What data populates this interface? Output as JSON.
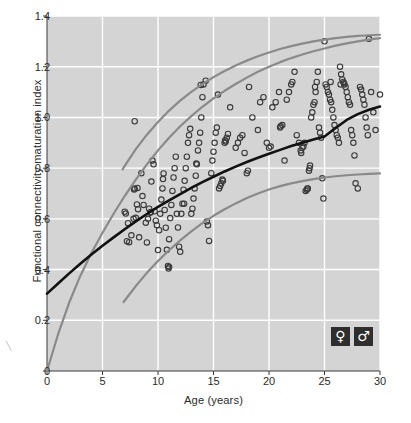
{
  "chart_data": {
    "type": "scatter",
    "title": "",
    "xlabel": "Age (years)",
    "ylabel": "Functional connectivity maturation index",
    "xlim": [
      0,
      30
    ],
    "ylim": [
      0,
      1.4
    ],
    "xticks": [
      "0",
      "5",
      "10",
      "15",
      "20",
      "25",
      "30"
    ],
    "yticks": [
      "0",
      "0.2",
      "0.4",
      "0.6",
      "0.8",
      "1.0",
      "1.2",
      "1.4"
    ],
    "xtick_values": [
      0,
      5,
      10,
      15,
      20,
      25,
      30
    ],
    "ytick_values": [
      0,
      0.2,
      0.4,
      0.6,
      0.8,
      1.0,
      1.2,
      1.4
    ],
    "grid": true,
    "grid_color": "#ffffff",
    "plot_background": "#d4d4d4",
    "marker": "open-circle",
    "marker_edge_color": "#3a3a3a",
    "marker_face_color": "none",
    "legend_position": "bottom-right",
    "legend": [
      {
        "symbol": "♀",
        "name": "female",
        "badge_color": "#2e2e2e"
      },
      {
        "symbol": "♂",
        "name": "male",
        "badge_color": "#2e2e2e"
      }
    ],
    "series": [
      {
        "name": "upper-percentile-curve",
        "type": "line",
        "color": "#8a8a8a",
        "width": 2.2,
        "points": [
          [
            0.0,
            0.0
          ],
          [
            1.0,
            0.145
          ],
          [
            2.0,
            0.27
          ],
          [
            3.0,
            0.375
          ],
          [
            4.0,
            0.465
          ],
          [
            5.0,
            0.545
          ],
          [
            6.0,
            0.62
          ],
          [
            7.0,
            0.69
          ],
          [
            8.0,
            0.755
          ],
          [
            9.0,
            0.815
          ],
          [
            10.0,
            0.87
          ],
          [
            11.0,
            0.92
          ],
          [
            12.0,
            0.965
          ],
          [
            13.0,
            1.005
          ],
          [
            14.0,
            1.042
          ],
          [
            15.0,
            1.075
          ],
          [
            16.0,
            1.105
          ],
          [
            17.0,
            1.132
          ],
          [
            18.0,
            1.157
          ],
          [
            19.0,
            1.18
          ],
          [
            20.0,
            1.2
          ],
          [
            21.0,
            1.218
          ],
          [
            22.0,
            1.234
          ],
          [
            23.0,
            1.248
          ],
          [
            24.0,
            1.261
          ],
          [
            25.0,
            1.272
          ],
          [
            26.0,
            1.283
          ],
          [
            27.0,
            1.292
          ],
          [
            28.0,
            1.3
          ],
          [
            29.0,
            1.307
          ],
          [
            30.0,
            1.313
          ]
        ]
      },
      {
        "name": "upper-sex-curve",
        "type": "line",
        "color": "#8a8a8a",
        "width": 2.2,
        "points": [
          [
            6.8,
            0.795
          ],
          [
            8.0,
            0.875
          ],
          [
            9.0,
            0.932
          ],
          [
            10.0,
            0.982
          ],
          [
            11.0,
            1.027
          ],
          [
            12.0,
            1.066
          ],
          [
            13.0,
            1.101
          ],
          [
            14.0,
            1.131
          ],
          [
            15.0,
            1.159
          ],
          [
            16.0,
            1.183
          ],
          [
            17.0,
            1.205
          ],
          [
            18.0,
            1.224
          ],
          [
            19.0,
            1.241
          ],
          [
            20.0,
            1.256
          ],
          [
            21.0,
            1.27
          ],
          [
            22.0,
            1.281
          ],
          [
            23.0,
            1.291
          ],
          [
            24.0,
            1.3
          ],
          [
            25.0,
            1.307
          ],
          [
            26.0,
            1.313
          ],
          [
            27.0,
            1.318
          ],
          [
            28.0,
            1.322
          ],
          [
            29.0,
            1.324
          ],
          [
            30.0,
            1.326
          ]
        ]
      },
      {
        "name": "mean-fit-curve",
        "type": "line",
        "color": "#111111",
        "width": 2.6,
        "points": [
          [
            0.0,
            0.305
          ],
          [
            1.0,
            0.345
          ],
          [
            2.0,
            0.385
          ],
          [
            3.0,
            0.423
          ],
          [
            4.0,
            0.459
          ],
          [
            5.0,
            0.494
          ],
          [
            6.0,
            0.527
          ],
          [
            7.0,
            0.559
          ],
          [
            8.0,
            0.59
          ],
          [
            9.0,
            0.619
          ],
          [
            10.0,
            0.647
          ],
          [
            11.0,
            0.673
          ],
          [
            12.0,
            0.698
          ],
          [
            13.0,
            0.722
          ],
          [
            14.0,
            0.745
          ],
          [
            15.0,
            0.766
          ],
          [
            16.0,
            0.787
          ],
          [
            17.0,
            0.806
          ],
          [
            18.0,
            0.824
          ],
          [
            19.0,
            0.841
          ],
          [
            20.0,
            0.857
          ],
          [
            21.0,
            0.872
          ],
          [
            22.0,
            0.887
          ],
          [
            23.0,
            0.9
          ],
          [
            24.0,
            0.913
          ],
          [
            25.0,
            0.925
          ],
          [
            26.0,
            0.958
          ],
          [
            27.0,
            0.99
          ],
          [
            28.0,
            1.013
          ],
          [
            29.0,
            1.03
          ],
          [
            30.0,
            1.043
          ]
        ]
      },
      {
        "name": "lower-sex-curve",
        "type": "line",
        "color": "#8a8a8a",
        "width": 2.2,
        "points": [
          [
            6.9,
            0.272
          ],
          [
            8.0,
            0.335
          ],
          [
            9.0,
            0.387
          ],
          [
            10.0,
            0.434
          ],
          [
            11.0,
            0.476
          ],
          [
            12.0,
            0.515
          ],
          [
            13.0,
            0.551
          ],
          [
            14.0,
            0.583
          ],
          [
            15.0,
            0.612
          ],
          [
            16.0,
            0.638
          ],
          [
            17.0,
            0.661
          ],
          [
            18.0,
            0.682
          ],
          [
            19.0,
            0.7
          ],
          [
            20.0,
            0.716
          ],
          [
            21.0,
            0.729
          ],
          [
            22.0,
            0.74
          ],
          [
            23.0,
            0.749
          ],
          [
            24.0,
            0.757
          ],
          [
            25.0,
            0.763
          ],
          [
            26.0,
            0.768
          ],
          [
            27.0,
            0.772
          ],
          [
            28.0,
            0.775
          ],
          [
            29.0,
            0.777
          ],
          [
            30.0,
            0.779
          ]
        ]
      }
    ],
    "points": [
      [
        7.9,
        0.985
      ],
      [
        7.0,
        0.628
      ],
      [
        7.1,
        0.621
      ],
      [
        7.3,
        0.583
      ],
      [
        7.2,
        0.512
      ],
      [
        7.4,
        0.508
      ],
      [
        7.6,
        0.535
      ],
      [
        7.8,
        0.6
      ],
      [
        7.9,
        0.72
      ],
      [
        7.85,
        0.716
      ],
      [
        8.0,
        0.604
      ],
      [
        8.1,
        0.657
      ],
      [
        8.2,
        0.638
      ],
      [
        8.3,
        0.527
      ],
      [
        8.5,
        0.78
      ],
      [
        8.6,
        0.69
      ],
      [
        8.7,
        0.655
      ],
      [
        8.9,
        0.585
      ],
      [
        9.0,
        0.507
      ],
      [
        9.1,
        0.6
      ],
      [
        9.2,
        0.64
      ],
      [
        9.3,
        0.624
      ],
      [
        9.4,
        0.747
      ],
      [
        9.5,
        0.83
      ],
      [
        9.6,
        0.815
      ],
      [
        9.7,
        0.63
      ],
      [
        9.8,
        0.593
      ],
      [
        9.9,
        0.575
      ],
      [
        10.0,
        0.477
      ],
      [
        10.1,
        0.555
      ],
      [
        10.2,
        0.62
      ],
      [
        10.3,
        0.676
      ],
      [
        10.4,
        0.72
      ],
      [
        10.45,
        0.757
      ],
      [
        10.5,
        0.779
      ],
      [
        10.6,
        0.635
      ],
      [
        10.7,
        0.565
      ],
      [
        10.8,
        0.478
      ],
      [
        10.9,
        0.414
      ],
      [
        10.95,
        0.404
      ],
      [
        11.0,
        0.52
      ],
      [
        11.1,
        0.603
      ],
      [
        11.2,
        0.655
      ],
      [
        11.3,
        0.71
      ],
      [
        11.4,
        0.763
      ],
      [
        11.5,
        0.8
      ],
      [
        11.6,
        0.845
      ],
      [
        11.7,
        0.62
      ],
      [
        11.8,
        0.566
      ],
      [
        11.9,
        0.49
      ],
      [
        12.0,
        0.47
      ],
      [
        12.1,
        0.62
      ],
      [
        12.2,
        0.66
      ],
      [
        12.3,
        0.715
      ],
      [
        12.4,
        0.75
      ],
      [
        12.5,
        0.8
      ],
      [
        12.6,
        0.845
      ],
      [
        12.7,
        0.9
      ],
      [
        12.8,
        0.93
      ],
      [
        12.9,
        0.955
      ],
      [
        13.0,
        0.62
      ],
      [
        13.1,
        0.64
      ],
      [
        13.2,
        0.68
      ],
      [
        13.3,
        0.72
      ],
      [
        13.4,
        0.77
      ],
      [
        13.5,
        0.815
      ],
      [
        13.6,
        0.87
      ],
      [
        13.7,
        0.9
      ],
      [
        13.8,
        0.94
      ],
      [
        13.9,
        1.0
      ],
      [
        14.0,
        1.08
      ],
      [
        13.85,
        1.128
      ],
      [
        14.1,
        1.13
      ],
      [
        14.3,
        1.145
      ],
      [
        14.4,
        0.59
      ],
      [
        14.5,
        0.575
      ],
      [
        14.6,
        0.513
      ],
      [
        14.8,
        0.78
      ],
      [
        14.9,
        0.83
      ],
      [
        15.0,
        0.865
      ],
      [
        15.1,
        0.9
      ],
      [
        15.2,
        0.94
      ],
      [
        15.3,
        0.96
      ],
      [
        15.4,
        1.09
      ],
      [
        15.5,
        0.72
      ],
      [
        15.6,
        0.73
      ],
      [
        15.7,
        0.74
      ],
      [
        15.8,
        0.755
      ],
      [
        16.0,
        0.9
      ],
      [
        16.1,
        0.905
      ],
      [
        16.2,
        0.92
      ],
      [
        16.3,
        0.935
      ],
      [
        16.5,
        1.04
      ],
      [
        17.0,
        0.88
      ],
      [
        17.2,
        0.9
      ],
      [
        17.4,
        0.92
      ],
      [
        17.6,
        0.93
      ],
      [
        17.8,
        0.86
      ],
      [
        18.0,
        0.78
      ],
      [
        18.2,
        1.12
      ],
      [
        18.5,
        1.0
      ],
      [
        19.0,
        0.95
      ],
      [
        19.2,
        1.06
      ],
      [
        19.5,
        1.08
      ],
      [
        19.8,
        0.9
      ],
      [
        20.0,
        0.88
      ],
      [
        20.3,
        1.04
      ],
      [
        20.6,
        1.06
      ],
      [
        20.9,
        1.1
      ],
      [
        21.0,
        0.96
      ],
      [
        21.2,
        0.97
      ],
      [
        21.4,
        0.83
      ],
      [
        21.6,
        1.07
      ],
      [
        21.8,
        1.1
      ],
      [
        22.0,
        1.13
      ],
      [
        22.1,
        1.14
      ],
      [
        22.3,
        1.18
      ],
      [
        22.5,
        0.93
      ],
      [
        22.7,
        0.9
      ],
      [
        22.9,
        0.86
      ],
      [
        23.0,
        0.88
      ],
      [
        23.1,
        0.885
      ],
      [
        23.2,
        0.9
      ],
      [
        23.3,
        0.71
      ],
      [
        23.4,
        0.715
      ],
      [
        23.5,
        0.72
      ],
      [
        23.6,
        0.79
      ],
      [
        23.65,
        0.8
      ],
      [
        23.7,
        0.81
      ],
      [
        23.8,
        1.0
      ],
      [
        23.9,
        1.02
      ],
      [
        24.0,
        1.05
      ],
      [
        24.1,
        1.06
      ],
      [
        24.2,
        1.1
      ],
      [
        24.3,
        1.14
      ],
      [
        24.4,
        1.18
      ],
      [
        24.5,
        0.96
      ],
      [
        24.6,
        0.94
      ],
      [
        24.7,
        0.92
      ],
      [
        24.8,
        0.76
      ],
      [
        24.9,
        0.68
      ],
      [
        25.0,
        1.3
      ],
      [
        25.1,
        1.13
      ],
      [
        25.2,
        1.12
      ],
      [
        25.3,
        1.1
      ],
      [
        25.4,
        1.09
      ],
      [
        25.5,
        1.07
      ],
      [
        25.6,
        1.06
      ],
      [
        25.7,
        1.03
      ],
      [
        25.8,
        1.0
      ],
      [
        25.9,
        0.97
      ],
      [
        26.0,
        0.95
      ],
      [
        26.1,
        0.93
      ],
      [
        26.2,
        0.92
      ],
      [
        26.3,
        0.9
      ],
      [
        26.4,
        1.2
      ],
      [
        26.5,
        1.17
      ],
      [
        26.6,
        1.15
      ],
      [
        26.7,
        1.14
      ],
      [
        26.75,
        1.135
      ],
      [
        26.8,
        1.13
      ],
      [
        26.9,
        1.12
      ],
      [
        27.0,
        1.1
      ],
      [
        27.1,
        1.08
      ],
      [
        27.2,
        1.06
      ],
      [
        27.3,
        1.05
      ],
      [
        27.4,
        0.95
      ],
      [
        27.5,
        0.93
      ],
      [
        27.6,
        0.9
      ],
      [
        27.7,
        0.85
      ],
      [
        27.8,
        0.74
      ],
      [
        28.0,
        0.72
      ],
      [
        28.2,
        1.12
      ],
      [
        28.3,
        1.11
      ],
      [
        28.4,
        1.09
      ],
      [
        28.5,
        1.07
      ],
      [
        28.6,
        1.05
      ],
      [
        28.7,
        1.0
      ],
      [
        28.8,
        0.96
      ],
      [
        28.9,
        0.93
      ],
      [
        29.0,
        1.31
      ],
      [
        29.2,
        1.1
      ],
      [
        29.4,
        1.02
      ],
      [
        29.6,
        0.95
      ],
      [
        30.0,
        1.09
      ],
      [
        11.0,
        0.41
      ],
      [
        8.15,
        0.722
      ],
      [
        24.15,
        1.12
      ],
      [
        25.55,
        1.14
      ],
      [
        26.45,
        1.13
      ],
      [
        23.45,
        0.72
      ],
      [
        12.35,
        0.66
      ],
      [
        9.35,
        0.627
      ],
      [
        16.05,
        0.91
      ],
      [
        15.85,
        0.75
      ],
      [
        13.45,
        0.818
      ],
      [
        20.15,
        0.885
      ],
      [
        22.85,
        0.87
      ],
      [
        21.05,
        0.965
      ],
      [
        18.1,
        0.79
      ]
    ]
  },
  "edge_mark": "╲"
}
